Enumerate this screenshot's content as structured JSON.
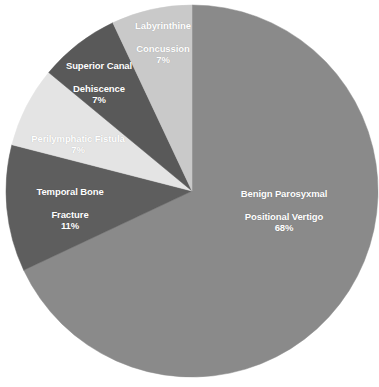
{
  "chart_data": {
    "type": "pie",
    "title": "",
    "subtitle": "",
    "xlabel": "",
    "ylabel": "",
    "legend": "none",
    "grid": false,
    "units": "percent",
    "start_angle_deg": 0,
    "direction": "clockwise",
    "categories": [
      "Benign Parosyxmal Positional Vertigo",
      "Temporal Bone Fracture",
      "Perilymphatic Fistula",
      "Superior Canal Dehiscence",
      "Labyrinthine Concussion"
    ],
    "values": [
      68,
      11,
      7,
      7,
      7
    ],
    "slices": [
      {
        "name": "Benign Parosyxmal Positional Vertigo",
        "label_line1": "Benign Parosyxmal",
        "label_line2": "Positional Vertigo",
        "value": 68,
        "percent_label": "68%",
        "color": "#8a8a8a"
      },
      {
        "name": "Temporal Bone Fracture",
        "label_line1": "Temporal Bone",
        "label_line2": "Fracture",
        "value": 11,
        "percent_label": "11%",
        "color": "#5e5e5e"
      },
      {
        "name": "Perilymphatic Fistula",
        "label_line1": "Perilymphatic Fistula",
        "label_line2": "",
        "value": 7,
        "percent_label": "7%",
        "color": "#e4e4e4"
      },
      {
        "name": "Superior Canal Dehiscence",
        "label_line1": "Superior Canal",
        "label_line2": "Dehiscence",
        "value": 7,
        "percent_label": "7%",
        "color": "#595959"
      },
      {
        "name": "Labyrinthine Concussion",
        "label_line1": "Labyrinthine",
        "label_line2": "Concussion",
        "value": 7,
        "percent_label": "7%",
        "color": "#c9c9c9"
      }
    ],
    "background_color": "#ffffff",
    "label_text_color": "#ffffff"
  },
  "geometry": {
    "center_x": 192,
    "center_y": 191,
    "radius": 186
  }
}
